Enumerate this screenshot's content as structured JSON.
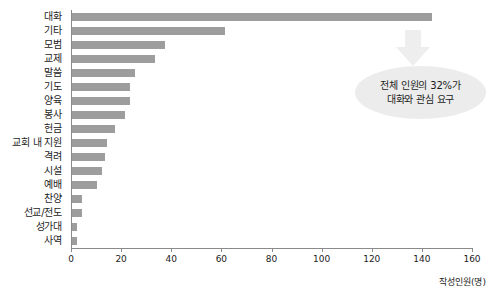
{
  "chart_data": {
    "type": "bar",
    "orientation": "horizontal",
    "title": "",
    "xlabel": "작성인원(명)",
    "ylabel": "",
    "xlim": [
      0,
      160
    ],
    "xticks": [
      0,
      20,
      40,
      60,
      80,
      100,
      120,
      140,
      160
    ],
    "grid": false,
    "legend": null,
    "bar_color": "#9d9d9d",
    "categories": [
      "대화",
      "기타",
      "모범",
      "교제",
      "말씀",
      "기도",
      "양육",
      "봉사",
      "헌금",
      "교회 내 지원",
      "격려",
      "시설",
      "예배",
      "찬양",
      "선교/전도",
      "성가대",
      "사역"
    ],
    "values": [
      144,
      61,
      37,
      33,
      25,
      23,
      23,
      21,
      17,
      14,
      13,
      12,
      10,
      4,
      4,
      2,
      2
    ],
    "annotations": [
      {
        "type": "callout",
        "shape": "ellipse",
        "lines": [
          "전체 인원의 32%가",
          "대화와 관심 요구"
        ],
        "fill": "#ececec",
        "arrow": {
          "direction": "down",
          "fill": "#eeeeee"
        }
      }
    ]
  },
  "axis": {
    "caption": "작성인원(명)"
  }
}
